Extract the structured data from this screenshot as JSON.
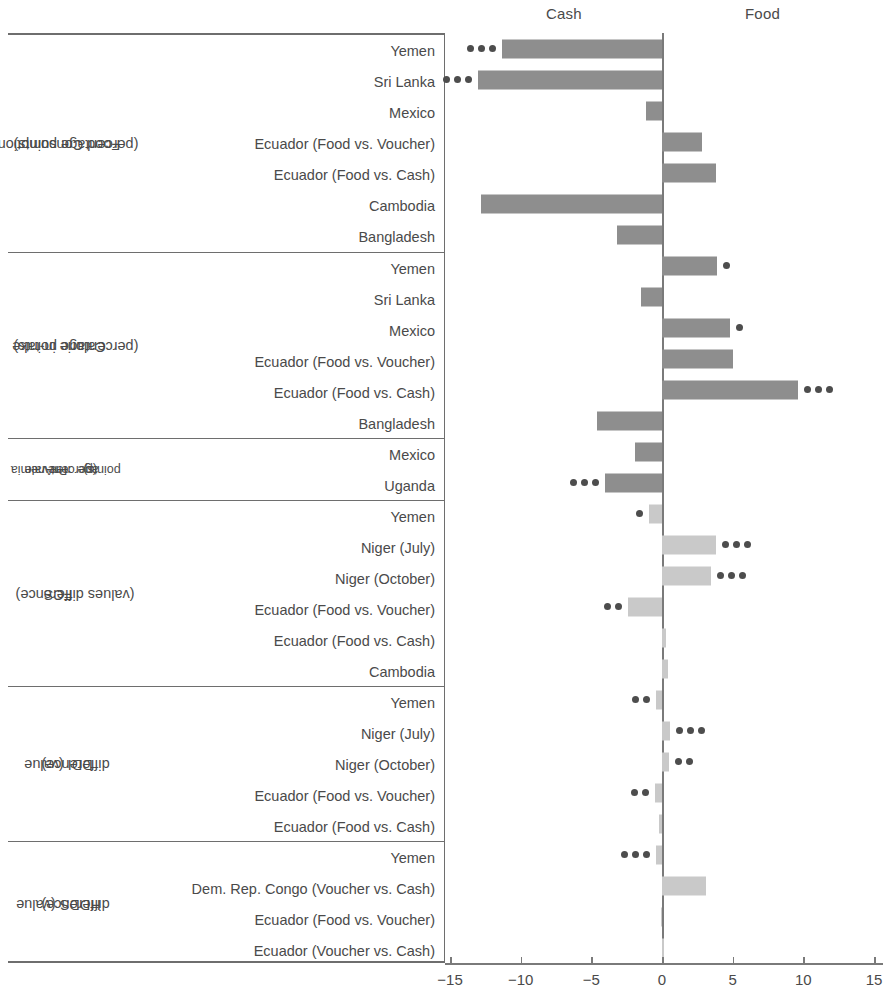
{
  "header": {
    "left_label": "Cash",
    "right_label": "Food"
  },
  "axis": {
    "ticks": [
      -15,
      -10,
      -5,
      0,
      5,
      10,
      15
    ],
    "tick_labels": [
      "−15",
      "−10",
      "−5",
      "0",
      "5",
      "10",
      "15"
    ],
    "min": -15,
    "max": 15
  },
  "colors": {
    "bar_dark": "#8e8e8e",
    "bar_light": "#c9c9c9",
    "dot": "#4d4d4d",
    "rule": "#6e6e6e",
    "text": "#4a4a4a"
  },
  "chart_data": {
    "type": "bar",
    "title": "",
    "xlabel": "",
    "ylabel": "",
    "xlim": [
      -15,
      15
    ],
    "grid": false,
    "orientation": "horizontal",
    "legend_position": "top",
    "annotations": {
      "negative_side": "Cash",
      "positive_side": "Food",
      "dots_meaning": "statistical significance markers"
    },
    "groups": [
      {
        "label": "Food Consumption\n(percentage points)",
        "label_lines": [
          "Food Consumption",
          "(percentage points)"
        ],
        "fill": "dark",
        "rows": [
          {
            "category": "Yemen",
            "value": -11.3,
            "dots": 3
          },
          {
            "category": "Sri Lanka",
            "value": -13.0,
            "dots": 3
          },
          {
            "category": "Mexico",
            "value": -1.1,
            "dots": 0
          },
          {
            "category": "Ecuador (Food vs. Voucher)",
            "value": 2.8,
            "dots": 0
          },
          {
            "category": "Ecuador (Food vs. Cash)",
            "value": 3.8,
            "dots": 0
          },
          {
            "category": "Cambodia",
            "value": -12.8,
            "dots": 0
          },
          {
            "category": "Bangladesh",
            "value": -3.2,
            "dots": 0
          }
        ]
      },
      {
        "label": "Calorie in-take\n(percentage points)",
        "label_lines": [
          "Calorie in-take",
          "(percentage points)"
        ],
        "fill": "dark",
        "rows": [
          {
            "category": "Yemen",
            "value": 3.9,
            "dots": 1
          },
          {
            "category": "Sri Lanka",
            "value": -1.5,
            "dots": 0
          },
          {
            "category": "Mexico",
            "value": 4.8,
            "dots": 1
          },
          {
            "category": "Ecuador (Food vs. Voucher)",
            "value": 5.0,
            "dots": 0
          },
          {
            "category": "Ecuador (Food vs. Cash)",
            "value": 9.6,
            "dots": 3
          },
          {
            "category": "Bangladesh",
            "value": -4.6,
            "dots": 0
          }
        ]
      },
      {
        "label": "Anemia Prevale nee (percent age points)",
        "label_lines": [
          "Anemia",
          "Prevale",
          "nee",
          "(percent",
          "age",
          "points)"
        ],
        "fill": "dark",
        "rows": [
          {
            "category": "Mexico",
            "value": -1.9,
            "dots": 0
          },
          {
            "category": "Uganda",
            "value": -4.0,
            "dots": 3
          }
        ]
      },
      {
        "label": "FCS\n(values difference)",
        "label_lines": [
          "FCS",
          "(values difference)"
        ],
        "fill": "light",
        "rows": [
          {
            "category": "Yemen",
            "value": -0.9,
            "dots": 1
          },
          {
            "category": "Niger (July)",
            "value": 3.8,
            "dots": 3
          },
          {
            "category": "Niger (October)",
            "value": 3.5,
            "dots": 3
          },
          {
            "category": "Ecuador (Food vs. Voucher)",
            "value": -2.4,
            "dots": 2
          },
          {
            "category": "Ecuador (Food vs. Cash)",
            "value": 0.3,
            "dots": 0
          },
          {
            "category": "Cambodia",
            "value": 0.4,
            "dots": 0
          }
        ]
      },
      {
        "label": "DDI (value difference)",
        "label_lines": [
          "DDI (value",
          "difference)"
        ],
        "fill": "light",
        "rows": [
          {
            "category": "Yemen",
            "value": -0.4,
            "dots": 2
          },
          {
            "category": "Niger (July)",
            "value": 0.6,
            "dots": 3
          },
          {
            "category": "Niger (October)",
            "value": 0.5,
            "dots": 2
          },
          {
            "category": "Ecuador (Food vs. Voucher)",
            "value": -0.5,
            "dots": 2
          },
          {
            "category": "Ecuador (Food vs. Cash)",
            "value": -0.2,
            "dots": 0
          }
        ]
      },
      {
        "label": "HDDS (value difference)",
        "label_lines": [
          "HDDS (value",
          "difference)"
        ],
        "fill": "light",
        "rows": [
          {
            "category": "Yemen",
            "value": -0.4,
            "dots": 3
          },
          {
            "category": "Dem. Rep. Congo (Voucher vs. Cash)",
            "value": 3.1,
            "dots": 0
          },
          {
            "category": "Ecuador (Food vs. Voucher)",
            "value": -0.1,
            "dots": 0
          },
          {
            "category": "Ecuador (Voucher vs. Cash)",
            "value": 0.05,
            "dots": 0
          }
        ]
      }
    ]
  }
}
